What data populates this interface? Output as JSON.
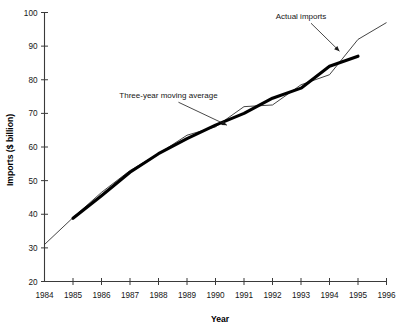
{
  "chart_data": {
    "type": "line",
    "title": "",
    "xlabel": "Year",
    "ylabel": "Imports ($ billion)",
    "xlim": [
      1984,
      1996
    ],
    "ylim": [
      20,
      100
    ],
    "grid": false,
    "legend_position": "inline-annotations",
    "x_ticks": [
      "1984",
      "1985",
      "1986",
      "1987",
      "1988",
      "1989",
      "1990",
      "1991",
      "1992",
      "1993",
      "1994",
      "1995",
      "1996"
    ],
    "y_ticks": [
      "20",
      "30",
      "40",
      "50",
      "60",
      "70",
      "80",
      "90",
      "100"
    ],
    "series": [
      {
        "name": "Actual imports",
        "style": "thin",
        "x": [
          1984,
          1985,
          1986,
          1987,
          1988,
          1989,
          1990,
          1991,
          1992,
          1993,
          1994,
          1995,
          1996
        ],
        "values": [
          31.0,
          39.0,
          46.5,
          53.0,
          58.0,
          63.5,
          66.0,
          72.0,
          72.5,
          78.5,
          81.5,
          92.0,
          97.0
        ]
      },
      {
        "name": "Three-year moving average",
        "style": "thick",
        "x": [
          1985,
          1986,
          1987,
          1988,
          1989,
          1990,
          1991,
          1992,
          1993,
          1994,
          1995
        ],
        "values": [
          38.8,
          45.5,
          52.5,
          58.0,
          62.5,
          66.5,
          70.0,
          74.5,
          77.5,
          84.0,
          87.0
        ]
      }
    ],
    "annotations": [
      {
        "text": "Actual imports",
        "x": 1993.0,
        "y": 98.0,
        "target_x": 1994.35,
        "target_y": 88.5
      },
      {
        "text": "Three-year moving average",
        "x": 1988.35,
        "y": 74.5,
        "target_x": 1990.4,
        "target_y": 66.5
      }
    ]
  },
  "labels": {
    "axis_x_title": "Year",
    "axis_y_title": "Imports ($ billion)",
    "annotation_actual": "Actual imports",
    "annotation_average": "Three-year moving average"
  }
}
